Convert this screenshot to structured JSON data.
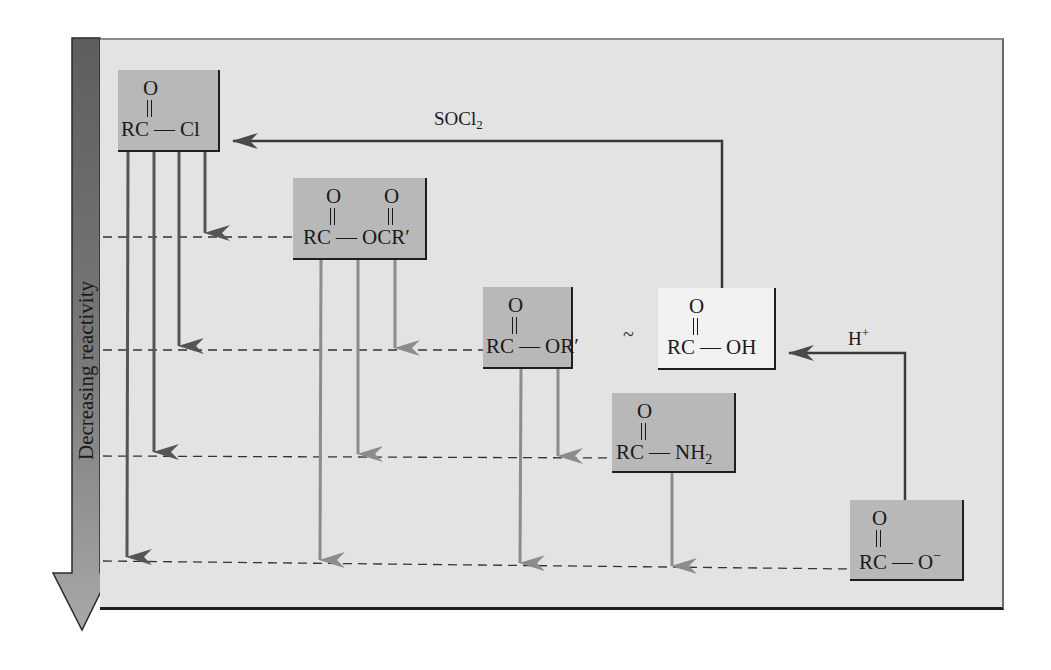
{
  "figure": {
    "axis_label": "Decreasing reactivity",
    "equivalence_symbol": "~",
    "colors": {
      "panel_background": "#e3e3e3",
      "box_fill": "#b8b8b8",
      "box_fill_highlight": "#f2f2f2",
      "sidebar_fill": "#6e6e6e",
      "sidebar_arrow_fill": "#9a9a9a",
      "arrow_dark": "#555555",
      "arrow_light": "#8c8c8c",
      "dashed_line": "#333333"
    }
  },
  "compounds": [
    {
      "id": "acid_chloride",
      "carbonyl": "O",
      "left": "RC",
      "bond": "—",
      "right": "Cl",
      "level": 1
    },
    {
      "id": "anhydride",
      "carbonyl": "O",
      "carbonyl2": "O",
      "left": "RC",
      "bond": "—",
      "right": "OCR′",
      "level": 2
    },
    {
      "id": "ester",
      "carbonyl": "O",
      "left": "RC",
      "bond": "—",
      "right": "OR′",
      "level": 3
    },
    {
      "id": "carboxylic_acid",
      "carbonyl": "O",
      "left": "RC",
      "bond": "—",
      "right": "OH",
      "level": 3
    },
    {
      "id": "amide",
      "carbonyl": "O",
      "left": "RC",
      "bond": "—",
      "right": "NH",
      "right_sub": "2",
      "level": 4
    },
    {
      "id": "carboxylate",
      "carbonyl": "O",
      "left": "RC",
      "bond": "—",
      "right": "O",
      "right_sup": "−",
      "level": 5
    }
  ],
  "reagents": {
    "acid_to_acid_chloride": {
      "main": "SOCl",
      "sub": "2"
    },
    "carboxylate_to_acid": {
      "main": "H",
      "sup": "+"
    }
  },
  "conversions": [
    {
      "from": "acid_chloride",
      "to": "anhydride"
    },
    {
      "from": "acid_chloride",
      "to": "ester"
    },
    {
      "from": "acid_chloride",
      "to": "amide"
    },
    {
      "from": "acid_chloride",
      "to": "carboxylate"
    },
    {
      "from": "anhydride",
      "to": "ester"
    },
    {
      "from": "anhydride",
      "to": "amide"
    },
    {
      "from": "anhydride",
      "to": "carboxylate"
    },
    {
      "from": "ester",
      "to": "amide"
    },
    {
      "from": "ester",
      "to": "carboxylate"
    },
    {
      "from": "amide",
      "to": "carboxylate"
    },
    {
      "from": "carboxylic_acid",
      "to": "acid_chloride",
      "reagent": "SOCl2"
    },
    {
      "from": "carboxylate",
      "to": "carboxylic_acid",
      "reagent": "H+"
    }
  ]
}
